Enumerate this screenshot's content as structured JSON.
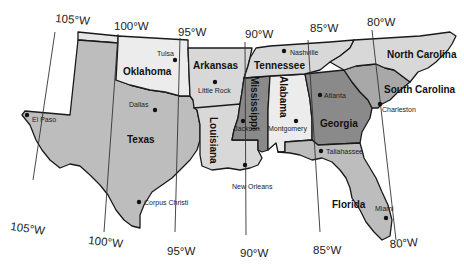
{
  "map": {
    "title": "",
    "colors": {
      "light": "#ececec",
      "lightgray": "#d8d8d8",
      "medium": "#bdbdbd",
      "mediumdark": "#a8a8a8",
      "dark": "#8a8a8a",
      "border": "#1a1a1a",
      "background": "#ffffff"
    },
    "states": [
      {
        "name": "Texas",
        "shade": "medium"
      },
      {
        "name": "Oklahoma",
        "shade": "light"
      },
      {
        "name": "Arkansas",
        "shade": "lightgray"
      },
      {
        "name": "Louisiana",
        "shade": "lightgray"
      },
      {
        "name": "Mississippi",
        "shade": "dark"
      },
      {
        "name": "Alabama",
        "shade": "light"
      },
      {
        "name": "Tennessee",
        "shade": "lightgray"
      },
      {
        "name": "Georgia",
        "shade": "dark"
      },
      {
        "name": "Florida",
        "shade": "medium"
      },
      {
        "name": "South Carolina",
        "shade": "mediumdark"
      },
      {
        "name": "North Carolina",
        "shade": "lightgray"
      }
    ],
    "cities": [
      {
        "name": "Tulsa"
      },
      {
        "name": "Little Rock"
      },
      {
        "name": "Dallas"
      },
      {
        "name": "El Paso"
      },
      {
        "name": "Corpus Christi"
      },
      {
        "name": "Jackson"
      },
      {
        "name": "Montgomery"
      },
      {
        "name": "New Orleans"
      },
      {
        "name": "Nashville"
      },
      {
        "name": "Atlanta"
      },
      {
        "name": "Tallahassee"
      },
      {
        "name": "Charleston"
      },
      {
        "name": "Miami"
      }
    ],
    "meridians_top": [
      "105°W",
      "100°W",
      "95°W",
      "90°W",
      "85°W",
      "80°W"
    ],
    "meridians_bottom": [
      "105°W",
      "100°W",
      "95°W",
      "90°W",
      "85°W",
      "80°W"
    ]
  }
}
